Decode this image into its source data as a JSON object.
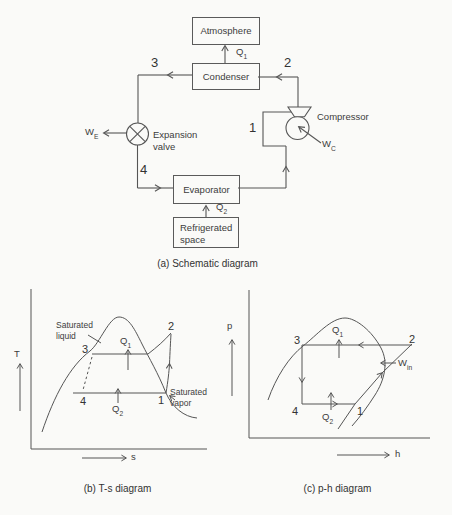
{
  "figure": {
    "schematic": {
      "caption": "(a) Schematic diagram",
      "atmosphere": "Atmosphere",
      "condenser": "Condenser",
      "evaporator": "Evaporator",
      "refrigerated_space": "Refrigerated space",
      "compressor": "Compressor",
      "expansion_valve": "Expansion valve",
      "q1": {
        "base": "Q",
        "sub": "1"
      },
      "q2": {
        "base": "Q",
        "sub": "2"
      },
      "wc": {
        "base": "W",
        "sub": "C"
      },
      "we": {
        "base": "W",
        "sub": "E"
      },
      "point1": "1",
      "point2": "2",
      "point3": "3",
      "point4": "4"
    },
    "ts": {
      "caption": "(b) T-s diagram",
      "y_label": "T",
      "x_label": "s",
      "saturated_liquid": "Saturated liquid",
      "saturated_vapor": "Saturated vapor",
      "q1": {
        "base": "Q",
        "sub": "1"
      },
      "q2": {
        "base": "Q",
        "sub": "2"
      },
      "point1": "1",
      "point2": "2",
      "point3": "3",
      "point4": "4"
    },
    "ph": {
      "caption": "(c) p-h diagram",
      "y_label": "p",
      "x_label": "h",
      "q1": {
        "base": "Q",
        "sub": "1"
      },
      "q2": {
        "base": "Q",
        "sub": "2"
      },
      "win": {
        "base": "W",
        "sub": "in"
      },
      "point1": "1",
      "point2": "2",
      "point3": "3",
      "point4": "4"
    }
  }
}
